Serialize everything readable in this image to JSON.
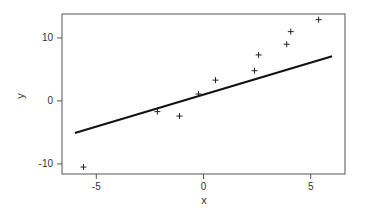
{
  "chart_data": {
    "type": "scatter",
    "title": "",
    "xlabel": "x",
    "ylabel": "y",
    "xlim": [
      -6.6,
      6.6
    ],
    "ylim": [
      -11.6,
      13.8
    ],
    "xticks": [
      -5,
      0,
      5
    ],
    "yticks": [
      -10,
      0,
      10
    ],
    "grid": false,
    "legend": null,
    "series": [
      {
        "name": "points",
        "type": "scatter",
        "marker": "+",
        "x": [
          -5.6,
          -2.15,
          -1.12,
          -0.23,
          0.56,
          2.38,
          2.57,
          3.88,
          4.07,
          5.37
        ],
        "y": [
          -10.5,
          -1.7,
          -2.4,
          1.1,
          3.3,
          4.8,
          7.3,
          9.0,
          11.0,
          12.9
        ]
      },
      {
        "name": "fit line",
        "type": "line",
        "x": [
          -6.0,
          6.0
        ],
        "y": [
          -5.1,
          7.1
        ]
      }
    ]
  },
  "colors": {
    "line": "#111111",
    "marker": "#222222",
    "axis": "#555555"
  }
}
